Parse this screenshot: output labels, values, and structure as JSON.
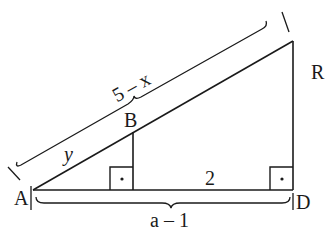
{
  "diagram": {
    "type": "geometry",
    "points": {
      "A": "A",
      "B": "B",
      "R": "R",
      "D": "D"
    },
    "segment_labels": {
      "AR": "5 – x",
      "AB": "y",
      "BD_foot": "2",
      "AD": "a – 1"
    },
    "right_angles": [
      "foot of B on AD",
      "D"
    ],
    "right_angle_marker": "•",
    "colors": {
      "stroke": "#1a1a1a",
      "background": "#ffffff"
    }
  }
}
